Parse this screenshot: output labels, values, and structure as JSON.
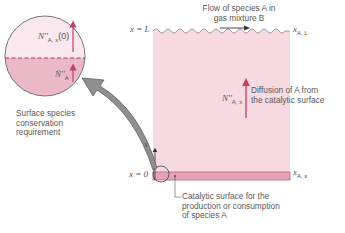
{
  "flow_label": {
    "line1": "Flow of species A in",
    "line2": "gas mixture B"
  },
  "x_eq_L": "x = L",
  "x_eq_0": "x = 0",
  "x_axis": "x",
  "x_A_L": {
    "base": "x",
    "sub": "A, L"
  },
  "x_A_s": {
    "base": "x",
    "sub": "A, s"
  },
  "flux_label": {
    "base": "N''",
    "sub": "A, x"
  },
  "diffusion_label": {
    "line1": "Diffusion of A from",
    "line2": "the catalytic surface"
  },
  "catalytic_label": {
    "line1": "Catalytic surface for the",
    "line2": "production or consumption",
    "line3": "of species A"
  },
  "circle": {
    "top_flux": {
      "base": "N''",
      "sub": "A, x",
      "arg": "(0)"
    },
    "bottom_flux": {
      "base": "Ṅ''",
      "sub": "A"
    }
  },
  "surface_label": {
    "line1": "Surface species",
    "line2": "conservation",
    "line3": "requirement"
  },
  "colors": {
    "medium_fill": "#f6d9e1",
    "surface_fill": "#e6a3b6",
    "surface_edge": "#b5677f",
    "arrow_red": "#c4405f",
    "circle_bottom": "#eab8c6",
    "big_arrow": "#8a8a8a"
  }
}
